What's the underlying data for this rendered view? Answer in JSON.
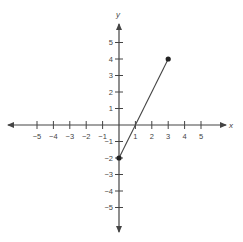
{
  "chart_data": {
    "type": "line",
    "title": "",
    "xlabel": "x",
    "ylabel": "y",
    "xlim": [
      -5,
      5
    ],
    "ylim": [
      -5,
      5
    ],
    "grid": false,
    "x_ticks": [
      -5,
      -4,
      -3,
      -2,
      -1,
      1,
      2,
      3,
      4,
      5
    ],
    "y_ticks": [
      -5,
      -4,
      -3,
      -2,
      -1,
      1,
      2,
      3,
      4,
      5
    ],
    "x_tick_labels": [
      "−5",
      "−4",
      "−3",
      "−2",
      "−1",
      "1",
      "2",
      "3",
      "4",
      "5"
    ],
    "y_tick_labels": [
      "−5",
      "−4",
      "−3",
      "−2",
      "−1",
      "1",
      "2",
      "3",
      "4",
      "5"
    ],
    "series": [
      {
        "name": "segment",
        "x": [
          0,
          3
        ],
        "y": [
          -2,
          4
        ],
        "endpoints": "closed"
      }
    ],
    "colors": {
      "axis": "#444444",
      "line": "#444444",
      "point": "#222222",
      "text": "#444444"
    }
  }
}
